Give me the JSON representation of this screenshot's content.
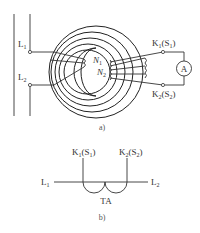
{
  "figure_a": {
    "caption": "a)",
    "primary_terminals": [
      {
        "label": "L",
        "sub": "1"
      },
      {
        "label": "L",
        "sub": "2"
      }
    ],
    "secondary_terminals": [
      {
        "label": "K",
        "sub": "1",
        "paren": "(S",
        "paren_sub": "1",
        "close": ")"
      },
      {
        "label": "K",
        "sub": "2",
        "paren": "(S",
        "paren_sub": "2",
        "close": ")"
      }
    ],
    "windings": [
      {
        "label": "N",
        "sub": "1"
      },
      {
        "label": "N",
        "sub": "2"
      }
    ],
    "meter": {
      "label": "A",
      "icon": "ammeter-icon"
    }
  },
  "figure_b": {
    "caption": "b)",
    "left_line": {
      "label": "L",
      "sub": "1"
    },
    "right_line": {
      "label": "L",
      "sub": "2"
    },
    "top_left": {
      "label": "K",
      "sub": "1",
      "paren": "(S",
      "paren_sub": "1",
      "close": ")"
    },
    "top_right": {
      "label": "K",
      "sub": "2",
      "paren": "(S",
      "paren_sub": "2",
      "close": ")"
    },
    "device_label": "TA"
  }
}
